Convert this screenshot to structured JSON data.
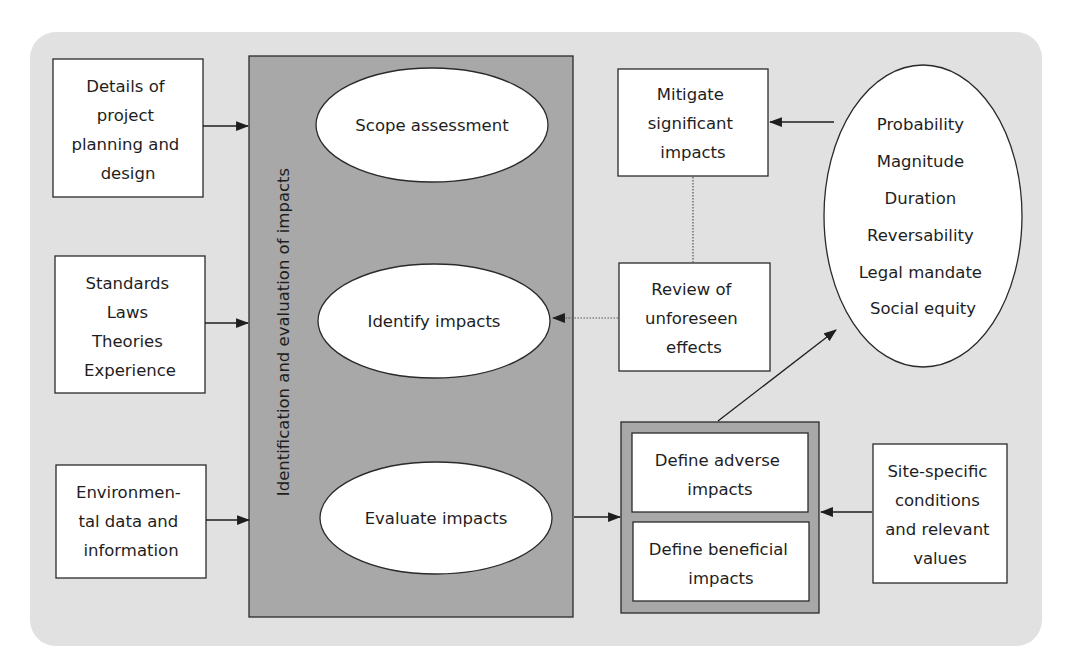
{
  "colors": {
    "outer_panel": "#e1e1e1",
    "central_panel": "#a8a8a8",
    "define_container": "#a8a8a8",
    "box_fill": "#ffffff",
    "stroke": "#2a2a2a",
    "text": "#1e1e1e"
  },
  "inputs": {
    "project": {
      "lines": [
        "Details of",
        "project",
        "planning and",
        "design"
      ]
    },
    "standards": {
      "lines": [
        "Standards",
        "Laws",
        "Theories",
        "Experience"
      ]
    },
    "environmental": {
      "lines": [
        "Environmen-",
        "tal data and",
        "information"
      ]
    }
  },
  "central": {
    "label": "Identification and evaluation of impacts",
    "steps": [
      {
        "label": "Scope assessment"
      },
      {
        "label": "Identify impacts"
      },
      {
        "label": "Evaluate impacts"
      }
    ]
  },
  "mitigate": {
    "lines": [
      "Mitigate",
      "significant",
      "impacts"
    ]
  },
  "review": {
    "lines": [
      "Review of",
      "unforeseen",
      "effects"
    ]
  },
  "criteria": {
    "items": [
      "Probability",
      "Magnitude",
      "Duration",
      "Reversability",
      "Legal mandate",
      "Social equity"
    ]
  },
  "define": {
    "adverse": {
      "lines": [
        "Define adverse",
        "impacts"
      ]
    },
    "beneficial": {
      "lines": [
        "Define beneficial",
        "impacts"
      ]
    }
  },
  "site": {
    "lines": [
      "Site-specific",
      "conditions",
      "and relevant",
      "values"
    ]
  }
}
